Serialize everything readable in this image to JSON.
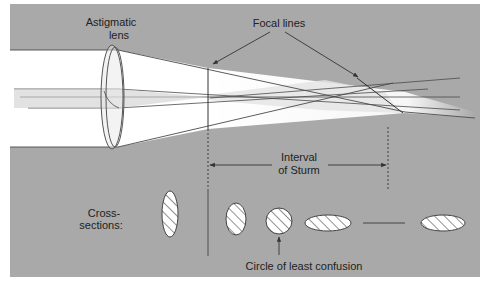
{
  "diagram": {
    "colors": {
      "panel": "#a9a9a9",
      "beam": "#ffffff",
      "beam_shade": "#d9d9d9",
      "line": "#4a4a4a",
      "text": "#222222"
    },
    "labels": {
      "lens_line1": "Astigmatic",
      "lens_line2": "lens",
      "focal_lines": "Focal lines",
      "interval_line1": "Interval",
      "interval_line2": "of Sturm",
      "cross_line1": "Cross-",
      "cross_line2": "sections:",
      "circle_least_confusion": "Circle of least confusion"
    },
    "cross_sections": [
      {
        "name": "before-first-focal-line",
        "shape": "vertical-ellipse",
        "cx": 170,
        "cy": 214,
        "rx": 8,
        "ry": 23
      },
      {
        "name": "after-first-focal-line",
        "shape": "vertical-ellipse",
        "cx": 236,
        "cy": 214,
        "rx": 10,
        "ry": 16
      },
      {
        "name": "circle-of-least-confusion",
        "shape": "circle",
        "cx": 279,
        "cy": 214,
        "rx": 13,
        "ry": 13
      },
      {
        "name": "horizontal-ellipse",
        "shape": "horizontal-ellipse",
        "cx": 328,
        "cy": 223,
        "rx": 23,
        "ry": 8
      },
      {
        "name": "second-focal-line",
        "shape": "line",
        "x1": 363,
        "x2": 405,
        "y": 223
      },
      {
        "name": "after-second-focal-line",
        "shape": "horizontal-ellipse",
        "cx": 443,
        "cy": 223,
        "rx": 22,
        "ry": 8
      }
    ]
  }
}
